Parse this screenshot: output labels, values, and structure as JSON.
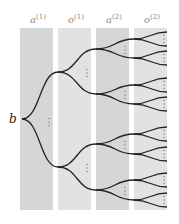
{
  "diagram": {
    "type": "tree",
    "root_label": "b",
    "columns": [
      {
        "label": "a",
        "sup": "(1)",
        "x": 20,
        "w": 33,
        "color": "#d6d6d6"
      },
      {
        "label": "o",
        "sup": "(1)",
        "x": 58,
        "w": 33,
        "color": "#e2e2e2"
      },
      {
        "label": "a",
        "sup": "(2)",
        "x": 96,
        "w": 33,
        "color": "#d6d6d6"
      },
      {
        "label": "o",
        "sup": "(2)",
        "x": 134,
        "w": 33,
        "color": "#e2e2e2"
      }
    ],
    "column_top": 28,
    "column_bottom": 210,
    "root": {
      "x": 22,
      "y": 119
    },
    "level1_nodes": [
      {
        "x": 58,
        "y": 72
      },
      {
        "x": 58,
        "y": 167
      }
    ],
    "level2_nodes": [
      {
        "x": 96,
        "y": 49
      },
      {
        "x": 96,
        "y": 94
      },
      {
        "x": 96,
        "y": 144
      },
      {
        "x": 96,
        "y": 190
      }
    ],
    "level3_nodes": [
      {
        "x": 134,
        "y": 39
      },
      {
        "x": 134,
        "y": 58
      },
      {
        "x": 134,
        "y": 85
      },
      {
        "x": 134,
        "y": 104
      },
      {
        "x": 134,
        "y": 134
      },
      {
        "x": 134,
        "y": 154
      },
      {
        "x": 134,
        "y": 180
      },
      {
        "x": 134,
        "y": 200
      }
    ],
    "leaf_x": 167,
    "leaf_spread": 7,
    "ellipsis": "⋮",
    "edge_color": "#222222"
  }
}
